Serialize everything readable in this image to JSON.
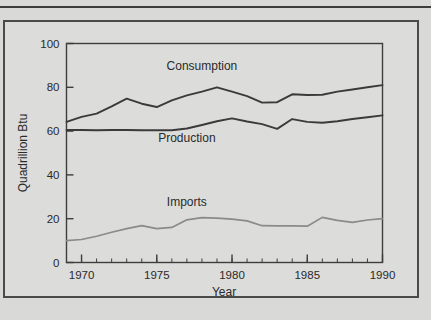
{
  "figure": {
    "background_color": "#d9d9d7",
    "panel_color": "#dcdcda",
    "frame_color": "#4a4a4a"
  },
  "chart_data": {
    "type": "line",
    "title": "",
    "subtitle": "",
    "xlabel": "Year",
    "ylabel": "Quadrillion Btu",
    "xlim": [
      1969,
      1990
    ],
    "ylim": [
      0,
      100
    ],
    "grid": false,
    "legend_position": "inline-labels",
    "x_tick_labels": [
      "1970",
      "1975",
      "1980",
      "1985",
      "1990"
    ],
    "x_major_ticks": [
      1970,
      1975,
      1980,
      1985,
      1990
    ],
    "x_minor_tick_interval": 1,
    "y_tick_labels": [
      "0",
      "20",
      "40",
      "60",
      "80",
      "100"
    ],
    "y_major_ticks": [
      0,
      20,
      40,
      60,
      80,
      100
    ],
    "x": [
      1969,
      1970,
      1971,
      1972,
      1973,
      1974,
      1975,
      1976,
      1977,
      1978,
      1979,
      1980,
      1981,
      1982,
      1983,
      1984,
      1985,
      1986,
      1987,
      1988,
      1989,
      1990
    ],
    "series": [
      {
        "name": "Consumption",
        "color": "#3a3a3a",
        "width": 1.9,
        "label_x": 1978,
        "label_y": 88,
        "values": [
          64.2,
          66.5,
          68.0,
          71.3,
          74.8,
          72.5,
          71.0,
          74.0,
          76.3,
          78.0,
          80.0,
          78.0,
          76.0,
          73.0,
          73.2,
          76.8,
          76.5,
          76.6,
          78.0,
          79.0,
          80.0,
          81.0
        ]
      },
      {
        "name": "Production",
        "color": "#3a3a3a",
        "width": 1.9,
        "label_x": 1977,
        "label_y": 55,
        "values": [
          60.5,
          60.5,
          60.4,
          60.5,
          60.5,
          60.4,
          60.4,
          60.4,
          61.2,
          62.8,
          64.5,
          65.8,
          64.4,
          63.2,
          61.0,
          65.5,
          64.2,
          63.8,
          64.5,
          65.5,
          66.3,
          67.2
        ]
      },
      {
        "name": "Imports",
        "color": "#8a8a8a",
        "width": 1.7,
        "label_x": 1977,
        "label_y": 26,
        "values": [
          10.0,
          10.5,
          12.0,
          13.8,
          15.5,
          16.8,
          15.5,
          16.0,
          19.5,
          20.5,
          20.3,
          19.8,
          19.0,
          16.8,
          16.7,
          16.7,
          16.6,
          20.6,
          19.2,
          18.3,
          19.4,
          20.0
        ]
      }
    ]
  },
  "axes": {
    "y_title": "Quadrillion Btu",
    "x_title": "Year"
  }
}
